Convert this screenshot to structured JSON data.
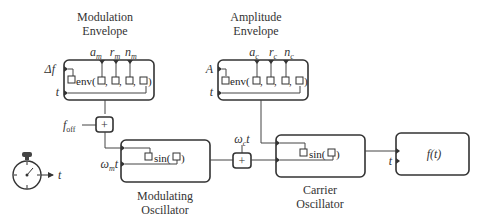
{
  "blocks": {
    "modulation_envelope": {
      "title_line1": "Modulation",
      "title_line2": "Envelope",
      "function": "env(",
      "params": [
        "a",
        "r",
        "n"
      ],
      "param_subscript": "m",
      "inputs": [
        "Δf",
        "t"
      ]
    },
    "amplitude_envelope": {
      "title_line1": "Amplitude",
      "title_line2": "Envelope",
      "function": "env(",
      "params": [
        "a",
        "r",
        "n"
      ],
      "param_subscript": "c",
      "inputs": [
        "A",
        "t"
      ]
    },
    "modulating_oscillator": {
      "title_line1": "Modulating",
      "title_line2": "Oscillator",
      "function": "sin(",
      "input_label": "ω",
      "input_subscript": "m",
      "input_suffix": "t"
    },
    "carrier_oscillator": {
      "title_line1": "Carrier",
      "title_line2": "Oscillator",
      "function": "sin(",
      "input_label": "ω",
      "input_subscript": "c",
      "input_suffix": "t"
    },
    "output": {
      "function": "f(t)",
      "input_label": "t"
    }
  },
  "adders": {
    "offset_adder": {
      "symbol": "+",
      "input_label": "f",
      "input_subscript": "off"
    },
    "carrier_adder": {
      "symbol": "+"
    }
  },
  "clock": {
    "output_label": "t"
  },
  "glyphs": {
    "close_paren": ")",
    "comma": ",",
    "port_box": "□"
  }
}
